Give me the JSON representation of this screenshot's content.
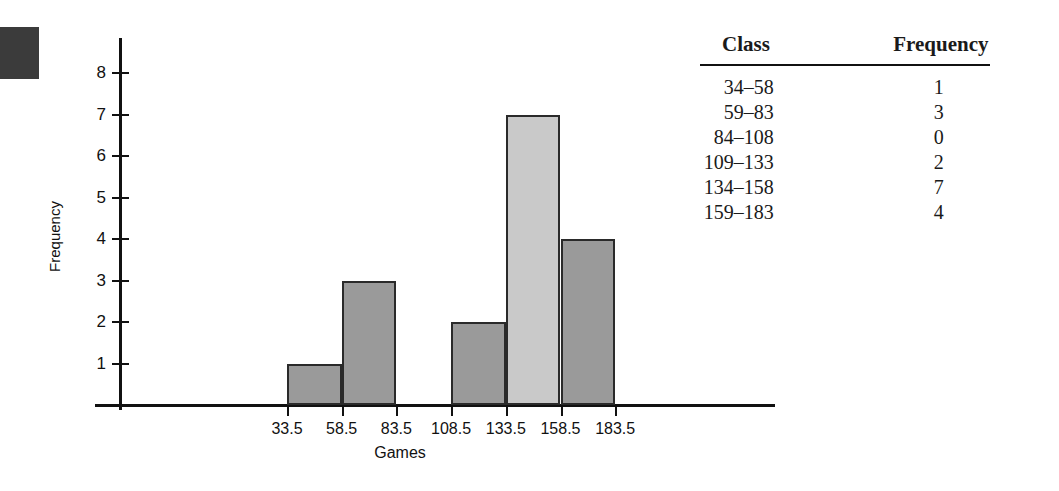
{
  "figure": {
    "marker": "black-square-marker"
  },
  "chart_data": {
    "type": "bar",
    "title": "",
    "xlabel": "Games",
    "ylabel": "Frequency",
    "categories": [
      "33.5-58.5",
      "58.5-83.5",
      "83.5-108.5",
      "108.5-133.5",
      "133.5-158.5",
      "158.5-183.5"
    ],
    "values": [
      1,
      3,
      0,
      2,
      7,
      4
    ],
    "bin_edges": [
      33.5,
      58.5,
      83.5,
      108.5,
      133.5,
      158.5,
      183.5
    ],
    "x_tick_labels": [
      "33.5",
      "58.5",
      "83.5",
      "108.5",
      "133.5",
      "158.5",
      "183.5"
    ],
    "y_tick_labels": [
      "1",
      "2",
      "3",
      "4",
      "5",
      "6",
      "7",
      "8"
    ],
    "ylim": [
      0,
      8.6
    ],
    "xlim": [
      33.5,
      183.5
    ],
    "grid": false,
    "legend": false,
    "bar_colors": [
      "#9a9a9a",
      "#9a9a9a",
      "#9a9a9a",
      "#9a9a9a",
      "#c9c9c9",
      "#9a9a9a"
    ],
    "bar_edge_color": "#2a2a2a"
  },
  "table": {
    "headers": [
      "Class",
      "Frequency"
    ],
    "rows": [
      {
        "class": "34–58",
        "frequency": "1"
      },
      {
        "class": "59–83",
        "frequency": "3"
      },
      {
        "class": "84–108",
        "frequency": "0"
      },
      {
        "class": "109–133",
        "frequency": "2"
      },
      {
        "class": "134–158",
        "frequency": "7"
      },
      {
        "class": "159–183",
        "frequency": "4"
      }
    ]
  }
}
